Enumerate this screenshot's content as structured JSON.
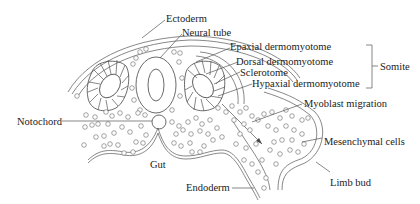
{
  "diagram": {
    "labels": {
      "ectoderm": "Ectoderm",
      "neural_tube": "Neural tube",
      "epaxial": "Epaxial dermomyotome",
      "dorsal": "Dorsal dermomyotome",
      "sclerotome": "Sclerotome",
      "hypaxial": "Hypaxial dermomyotome",
      "somite": "Somite",
      "myoblast": "Myoblast migration",
      "notochord": "Notochord",
      "mesenchymal": "Mesenchymal cells",
      "gut": "Gut",
      "endoderm": "Endoderm",
      "limb_bud": "Limb bud"
    },
    "colors": {
      "line": "#444444",
      "text": "#222222",
      "background": "#ffffff"
    }
  }
}
